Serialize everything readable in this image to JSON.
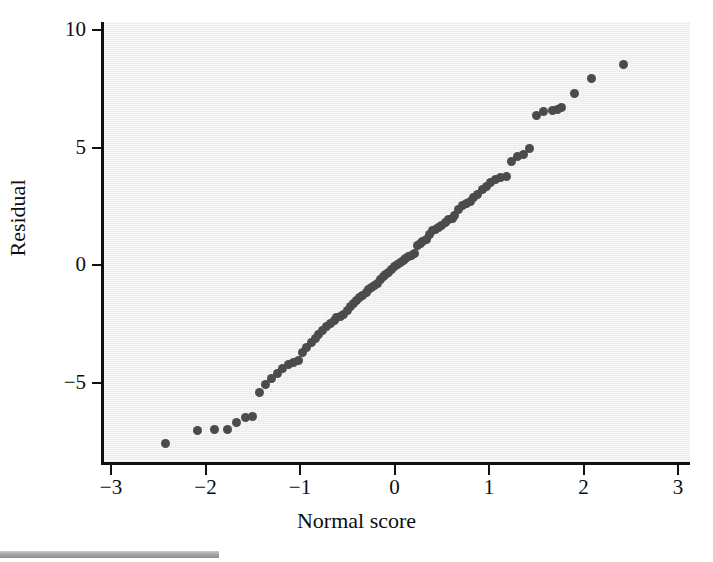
{
  "chart_data": {
    "type": "scatter",
    "title": "",
    "subtitle": "",
    "xlabel": "Normal score",
    "ylabel": "Residual",
    "xlim": [
      -3,
      3
    ],
    "ylim": [
      -8.6,
      10
    ],
    "xticks": [
      -3,
      -2,
      -1,
      0,
      1,
      2,
      3
    ],
    "xticklabels": [
      "−3",
      "−2",
      "−1",
      "0",
      "1",
      "2",
      "3"
    ],
    "yticks": [
      10,
      5,
      0,
      -5
    ],
    "yticklabels": [
      "10",
      "5",
      "0",
      "−5"
    ],
    "grid": false,
    "legend": null,
    "marker": {
      "shape": "circle",
      "color": "#4b4b4b",
      "size_px": 9
    },
    "panel_color": "#e9e9e9",
    "axis_color": "#111111",
    "series": [
      {
        "name": "Residuals vs normal score",
        "points": [
          [
            -2.42,
            -7.58
          ],
          [
            -2.08,
            -7.05
          ],
          [
            -1.9,
            -7.0
          ],
          [
            -1.77,
            -7.02
          ],
          [
            -1.67,
            -6.72
          ],
          [
            -1.58,
            -6.5
          ],
          [
            -1.5,
            -6.45
          ],
          [
            -1.43,
            -5.42
          ],
          [
            -1.36,
            -5.1
          ],
          [
            -1.3,
            -4.85
          ],
          [
            -1.24,
            -4.6
          ],
          [
            -1.18,
            -4.42
          ],
          [
            -1.12,
            -4.25
          ],
          [
            -1.07,
            -4.15
          ],
          [
            -1.02,
            -4.08
          ],
          [
            -0.97,
            -3.72
          ],
          [
            -0.93,
            -3.5
          ],
          [
            -0.88,
            -3.3
          ],
          [
            -0.84,
            -3.12
          ],
          [
            -0.8,
            -2.95
          ],
          [
            -0.76,
            -2.78
          ],
          [
            -0.72,
            -2.62
          ],
          [
            -0.68,
            -2.48
          ],
          [
            -0.64,
            -2.35
          ],
          [
            -0.61,
            -2.22
          ],
          [
            -0.57,
            -2.18
          ],
          [
            -0.54,
            -2.12
          ],
          [
            -0.5,
            -1.92
          ],
          [
            -0.47,
            -1.78
          ],
          [
            -0.43,
            -1.62
          ],
          [
            -0.4,
            -1.5
          ],
          [
            -0.37,
            -1.4
          ],
          [
            -0.34,
            -1.28
          ],
          [
            -0.3,
            -1.18
          ],
          [
            -0.27,
            -1.05
          ],
          [
            -0.24,
            -0.95
          ],
          [
            -0.21,
            -0.88
          ],
          [
            -0.18,
            -0.78
          ],
          [
            -0.15,
            -0.62
          ],
          [
            -0.12,
            -0.5
          ],
          [
            -0.09,
            -0.4
          ],
          [
            -0.06,
            -0.3
          ],
          [
            -0.03,
            -0.2
          ],
          [
            0.0,
            -0.08
          ],
          [
            0.03,
            0.02
          ],
          [
            0.06,
            0.1
          ],
          [
            0.09,
            0.18
          ],
          [
            0.12,
            0.28
          ],
          [
            0.15,
            0.35
          ],
          [
            0.18,
            0.42
          ],
          [
            0.21,
            0.5
          ],
          [
            0.24,
            0.82
          ],
          [
            0.27,
            0.92
          ],
          [
            0.3,
            1.0
          ],
          [
            0.34,
            1.1
          ],
          [
            0.37,
            1.3
          ],
          [
            0.4,
            1.45
          ],
          [
            0.43,
            1.52
          ],
          [
            0.47,
            1.58
          ],
          [
            0.5,
            1.7
          ],
          [
            0.54,
            1.82
          ],
          [
            0.57,
            1.92
          ],
          [
            0.61,
            2.0
          ],
          [
            0.64,
            2.12
          ],
          [
            0.68,
            2.35
          ],
          [
            0.72,
            2.52
          ],
          [
            0.76,
            2.62
          ],
          [
            0.8,
            2.7
          ],
          [
            0.84,
            2.88
          ],
          [
            0.88,
            3.0
          ],
          [
            0.93,
            3.2
          ],
          [
            0.97,
            3.35
          ],
          [
            1.02,
            3.5
          ],
          [
            1.07,
            3.62
          ],
          [
            1.12,
            3.72
          ],
          [
            1.18,
            3.75
          ],
          [
            1.24,
            4.4
          ],
          [
            1.3,
            4.62
          ],
          [
            1.36,
            4.7
          ],
          [
            1.43,
            4.95
          ],
          [
            1.5,
            6.35
          ],
          [
            1.58,
            6.55
          ],
          [
            1.67,
            6.58
          ],
          [
            1.72,
            6.6
          ],
          [
            1.77,
            6.72
          ],
          [
            1.9,
            7.3
          ],
          [
            2.08,
            7.92
          ],
          [
            2.42,
            8.55
          ]
        ]
      }
    ]
  },
  "axes": {
    "x_title": "Normal score",
    "y_title": "Residual",
    "x_tick_labels": [
      "−3",
      "−2",
      "−1",
      "0",
      "1",
      "2",
      "3"
    ],
    "y_tick_labels": [
      "10",
      "5",
      "0",
      "−5"
    ]
  }
}
